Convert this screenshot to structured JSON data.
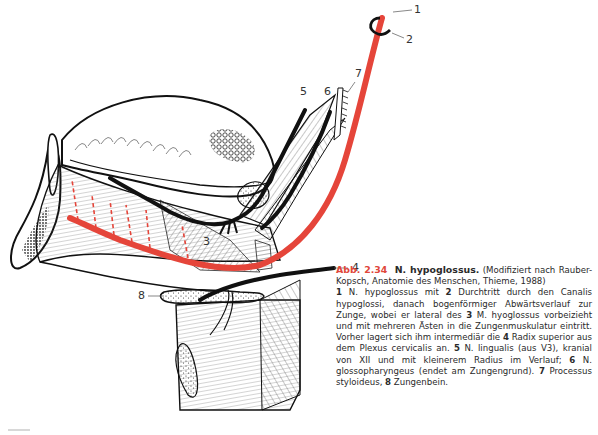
{
  "figure": {
    "nerve_color": "#e5453a",
    "labels": [
      {
        "id": "1",
        "text": "1"
      },
      {
        "id": "2",
        "text": "2"
      },
      {
        "id": "3",
        "text": "3"
      },
      {
        "id": "4",
        "text": "4"
      },
      {
        "id": "5",
        "text": "5"
      },
      {
        "id": "6",
        "text": "6"
      },
      {
        "id": "7",
        "text": "7"
      },
      {
        "id": "8",
        "text": "8"
      }
    ]
  },
  "caption": {
    "fig_number": "Abb. 2.34",
    "fig_title": "N. hypoglossus.",
    "source": "(Modifiziert nach Rauber-Kopsch, Anatomie des Menschen, Thieme, 1988)",
    "body": [
      {
        "num": "1",
        "text": " N. hypoglossus mit "
      },
      {
        "num": "2",
        "text": " Durchtritt durch den Canalis hypoglossi, danach bogenförmiger Abwärtsverlauf zur Zunge, wobei er lateral des "
      },
      {
        "num": "3",
        "text": " M. hyoglossus vorbeizieht und mit mehreren Ästen in die Zungenmuskulatur eintritt. Vorher lagert sich ihm intermediär die "
      },
      {
        "num": "4",
        "text": " Radix superior aus dem Plexus cervicalis an. "
      },
      {
        "num": "5",
        "text": " N. lingualis (aus V3), kranial von XII und mit kleinerem Radius im Verlauf; "
      },
      {
        "num": "6",
        "text": " N. glossopharyngeus (endet am Zungengrund). "
      },
      {
        "num": "7",
        "text": " Processus styloideus, "
      },
      {
        "num": "8",
        "text": " Zungenbein."
      }
    ],
    "accent_color": "#e0473a"
  }
}
